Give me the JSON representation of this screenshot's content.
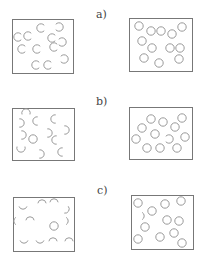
{
  "colors": {
    "box_stroke": "#777777",
    "circle_stroke": "#9a9a9a",
    "label": "#444444",
    "background": "#ffffff"
  },
  "panels": [
    {
      "label": "a)",
      "label_pos": [
        96,
        9
      ],
      "left_box": {
        "rect": [
          12,
          19,
          61,
          54
        ],
        "circles": [
          {
            "x": 18,
            "y": 37,
            "type": "open-right"
          },
          {
            "x": 28,
            "y": 36,
            "type": "open-right"
          },
          {
            "x": 41,
            "y": 28,
            "type": "open-right"
          },
          {
            "x": 59,
            "y": 27,
            "type": "open-left"
          },
          {
            "x": 52,
            "y": 38,
            "type": "open-right"
          },
          {
            "x": 62,
            "y": 42,
            "type": "open-left"
          },
          {
            "x": 54,
            "y": 47,
            "type": "open-right"
          },
          {
            "x": 22,
            "y": 49,
            "type": "open-right"
          },
          {
            "x": 37,
            "y": 49,
            "type": "open-right"
          },
          {
            "x": 36,
            "y": 65,
            "type": "open-right"
          },
          {
            "x": 48,
            "y": 65,
            "type": "open-right"
          },
          {
            "x": 64,
            "y": 59,
            "type": "open-left"
          }
        ]
      },
      "right_box": {
        "rect": [
          129,
          18,
          63,
          53
        ],
        "circles": [
          {
            "x": 139,
            "y": 26,
            "type": "full"
          },
          {
            "x": 151,
            "y": 31,
            "type": "full"
          },
          {
            "x": 161,
            "y": 31,
            "type": "full"
          },
          {
            "x": 182,
            "y": 27,
            "type": "full"
          },
          {
            "x": 172,
            "y": 34,
            "type": "full"
          },
          {
            "x": 142,
            "y": 41,
            "type": "full"
          },
          {
            "x": 152,
            "y": 48,
            "type": "full"
          },
          {
            "x": 170,
            "y": 48,
            "type": "full"
          },
          {
            "x": 180,
            "y": 48,
            "type": "full"
          },
          {
            "x": 144,
            "y": 58,
            "type": "full"
          },
          {
            "x": 159,
            "y": 63,
            "type": "full"
          },
          {
            "x": 179,
            "y": 59,
            "type": "full"
          }
        ]
      }
    },
    {
      "label": "b)",
      "label_pos": [
        96,
        96
      ],
      "left_box": {
        "rect": [
          12,
          108,
          62,
          52
        ],
        "circles": [
          {
            "x": 26,
            "y": 113,
            "type": "half-top"
          },
          {
            "x": 37,
            "y": 121,
            "type": "half-left"
          },
          {
            "x": 20,
            "y": 123,
            "type": "half-right"
          },
          {
            "x": 55,
            "y": 119,
            "type": "half-left"
          },
          {
            "x": 65,
            "y": 130,
            "type": "half-right"
          },
          {
            "x": 22,
            "y": 135,
            "type": "half-right"
          },
          {
            "x": 33,
            "y": 139,
            "type": "full"
          },
          {
            "x": 48,
            "y": 133,
            "type": "half-right"
          },
          {
            "x": 56,
            "y": 140,
            "type": "half-left"
          },
          {
            "x": 21,
            "y": 148,
            "type": "half-bottom"
          },
          {
            "x": 40,
            "y": 154,
            "type": "half-right"
          },
          {
            "x": 62,
            "y": 152,
            "type": "half-left"
          }
        ]
      },
      "right_box": {
        "rect": [
          129,
          107,
          63,
          52
        ],
        "circles": [
          {
            "x": 151,
            "y": 119,
            "type": "full"
          },
          {
            "x": 163,
            "y": 122,
            "type": "full"
          },
          {
            "x": 182,
            "y": 118,
            "type": "full"
          },
          {
            "x": 142,
            "y": 128,
            "type": "full"
          },
          {
            "x": 175,
            "y": 127,
            "type": "full"
          },
          {
            "x": 155,
            "y": 134,
            "type": "full"
          },
          {
            "x": 136,
            "y": 139,
            "type": "full"
          },
          {
            "x": 169,
            "y": 139,
            "type": "open-left"
          },
          {
            "x": 185,
            "y": 137,
            "type": "full"
          },
          {
            "x": 147,
            "y": 148,
            "type": "full"
          },
          {
            "x": 160,
            "y": 148,
            "type": "full"
          },
          {
            "x": 177,
            "y": 148,
            "type": "full"
          }
        ]
      }
    },
    {
      "label": "c)",
      "label_pos": [
        97,
        185
      ],
      "left_box": {
        "rect": [
          13,
          197,
          61,
          54
        ],
        "circles": [
          {
            "x": 23,
            "y": 205,
            "type": "arc-bottom"
          },
          {
            "x": 42,
            "y": 204,
            "type": "arc-top"
          },
          {
            "x": 54,
            "y": 203,
            "type": "arc-top"
          },
          {
            "x": 65,
            "y": 209,
            "type": "arc-right-low"
          },
          {
            "x": 18,
            "y": 221,
            "type": "arc-left"
          },
          {
            "x": 30,
            "y": 221,
            "type": "arc-top"
          },
          {
            "x": 54,
            "y": 226,
            "type": "full"
          },
          {
            "x": 64,
            "y": 221,
            "type": "arc-right"
          },
          {
            "x": 24,
            "y": 239,
            "type": "arc-bottom"
          },
          {
            "x": 40,
            "y": 239,
            "type": "arc-bottom"
          },
          {
            "x": 53,
            "y": 242,
            "type": "arc-top"
          },
          {
            "x": 69,
            "y": 242,
            "type": "arc-top"
          }
        ]
      },
      "right_box": {
        "rect": [
          131,
          195,
          62,
          54
        ],
        "circles": [
          {
            "x": 138,
            "y": 203,
            "type": "full"
          },
          {
            "x": 165,
            "y": 204,
            "type": "full"
          },
          {
            "x": 181,
            "y": 201,
            "type": "full"
          },
          {
            "x": 152,
            "y": 211,
            "type": "full"
          },
          {
            "x": 140,
            "y": 216,
            "type": "arc-right"
          },
          {
            "x": 167,
            "y": 220,
            "type": "full"
          },
          {
            "x": 179,
            "y": 221,
            "type": "full"
          },
          {
            "x": 145,
            "y": 227,
            "type": "full"
          },
          {
            "x": 138,
            "y": 239,
            "type": "full"
          },
          {
            "x": 160,
            "y": 237,
            "type": "full"
          },
          {
            "x": 174,
            "y": 233,
            "type": "full"
          },
          {
            "x": 182,
            "y": 243,
            "type": "full"
          }
        ]
      }
    }
  ]
}
